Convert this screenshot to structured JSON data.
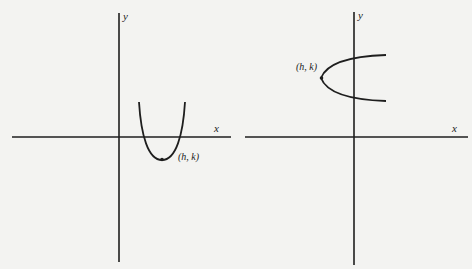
{
  "figures": [
    {
      "name": "vertical-parabola",
      "axis_labels": {
        "x": "x",
        "y": "y"
      },
      "vertex_label": "(h, k)",
      "opens": "up"
    },
    {
      "name": "horizontal-parabola",
      "axis_labels": {
        "x": "x",
        "y": "y"
      },
      "vertex_label": "(h, k)",
      "opens": "right"
    }
  ],
  "colors": {
    "ink": "#1e1e1e",
    "paper": "#f3f3f1"
  }
}
